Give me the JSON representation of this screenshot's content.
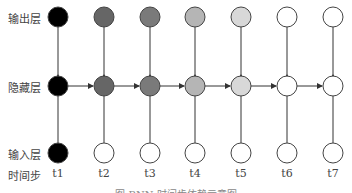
{
  "rows": {
    "output": {
      "label": "输出层",
      "y": 17
    },
    "hidden": {
      "label": "隐藏层",
      "y": 86
    },
    "input": {
      "label": "输入层",
      "y": 153
    }
  },
  "time_label": "时间步",
  "time_steps": [
    "t1",
    "t2",
    "t3",
    "t4",
    "t5",
    "t6",
    "t7"
  ],
  "node_x": [
    58,
    104,
    150,
    195,
    241,
    287,
    333
  ],
  "node_fill": {
    "output": [
      "#000000",
      "#666666",
      "#7a7a7a",
      "#b5b5b5",
      "#d8d8d8",
      "#ffffff",
      "#ffffff"
    ],
    "hidden": [
      "#000000",
      "#666666",
      "#7a7a7a",
      "#b5b5b5",
      "#d8d8d8",
      "#ffffff",
      "#ffffff"
    ],
    "input": [
      "#000000",
      "#ffffff",
      "#ffffff",
      "#ffffff",
      "#ffffff",
      "#ffffff",
      "#ffffff"
    ]
  },
  "caption": "图 RNN 时间步依赖示意图"
}
